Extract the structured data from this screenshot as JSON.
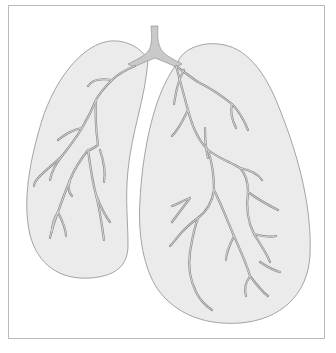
{
  "figure": {
    "title": "Lungs with bronchial tree",
    "parts": {
      "trachea": "trachea",
      "left_lung": "left lung",
      "right_lung": "right lung",
      "bronchi": "bronchial branches"
    }
  },
  "colors": {
    "background": "#ffffff",
    "frame_border": "#b9b9b9",
    "lung_fill": "#ebebeb",
    "lung_outline": "#9a9a9a",
    "trachea_fill": "#c9c9c9",
    "bronchi_stroke": "#8a8a8a",
    "bronchi_inner": "#e6e6e6"
  }
}
